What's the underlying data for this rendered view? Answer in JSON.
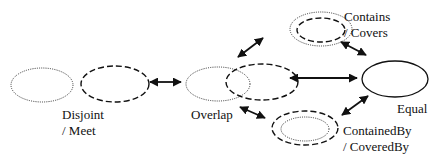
{
  "diagram": {
    "type": "spatial-relation-transition-graph",
    "nodes": {
      "disjoint": {
        "line1": "Disjoint",
        "line2": "/ Meet"
      },
      "overlap": {
        "line1": "Overlap"
      },
      "contains": {
        "line1": "Contains",
        "line2": "/ Covers"
      },
      "equal": {
        "line1": "Equal"
      },
      "containedby": {
        "line1": "ContainedBy",
        "line2": "/ CoveredBy"
      }
    },
    "edges": [
      {
        "from": "Disjoint / Meet",
        "to": "Overlap",
        "bidirectional": true
      },
      {
        "from": "Overlap",
        "to": "Contains / Covers",
        "bidirectional": true
      },
      {
        "from": "Overlap",
        "to": "Equal",
        "bidirectional": true
      },
      {
        "from": "Overlap",
        "to": "ContainedBy / CoveredBy",
        "bidirectional": true
      },
      {
        "from": "Contains / Covers",
        "to": "Equal",
        "bidirectional": true
      },
      {
        "from": "ContainedBy / CoveredBy",
        "to": "Equal",
        "bidirectional": true
      }
    ],
    "colors": {
      "stroke": "#111111",
      "background": "#ffffff"
    }
  }
}
